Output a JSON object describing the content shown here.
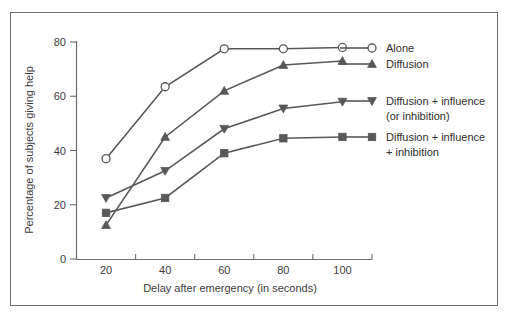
{
  "figure": {
    "border_color": "#6e6e6e",
    "background": "#ffffff",
    "line_color": "#58585a"
  },
  "axes": {
    "y_title": "Percentage of subjects giving help",
    "x_title": "Delay after emergency (in seconds)",
    "y_ticks": [
      "0",
      "20",
      "40",
      "60",
      "80"
    ],
    "x_ticks": [
      "20",
      "40",
      "60",
      "80",
      "100"
    ]
  },
  "legend": {
    "entries": [
      {
        "label": "Alone",
        "marker": "open-circle"
      },
      {
        "label": "Diffusion",
        "marker": "up-triangle"
      },
      {
        "label_line1": "Diffusion + influence",
        "label_line2": "(or inhibition)",
        "marker": "down-triangle"
      },
      {
        "label_line1": "Diffusion + influence",
        "label_line2": "+ inhibition",
        "marker": "square"
      }
    ]
  },
  "chart_data": {
    "type": "line",
    "title": "",
    "xlabel": "Delay after emergency (in seconds)",
    "ylabel": "Percentage of subjects giving help",
    "x": [
      20,
      40,
      60,
      80,
      100
    ],
    "xlim": [
      10,
      110
    ],
    "ylim": [
      0,
      80
    ],
    "grid": false,
    "legend_position": "right",
    "series": [
      {
        "name": "Alone",
        "marker": "open-circle",
        "values": [
          37,
          63.5,
          77.5,
          77.5,
          78
        ]
      },
      {
        "name": "Diffusion",
        "marker": "up-triangle",
        "values": [
          12.5,
          45,
          62,
          71.5,
          73
        ]
      },
      {
        "name": "Diffusion + influence (or inhibition)",
        "marker": "down-triangle",
        "values": [
          22.5,
          32.5,
          48,
          55.5,
          58
        ]
      },
      {
        "name": "Diffusion + influence + inhibition",
        "marker": "square",
        "values": [
          17,
          22.5,
          39,
          44.5,
          45
        ]
      }
    ]
  }
}
